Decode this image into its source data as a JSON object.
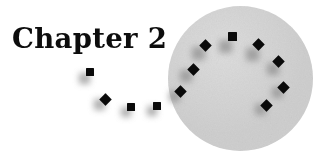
{
  "page": {
    "width": 325,
    "height": 165,
    "background_color": "#ffffff"
  },
  "title": {
    "text": "Chapter 2",
    "color": "#0d0d0d"
  },
  "disc": {
    "name": "gray-circle",
    "center_x": 240,
    "center_y": 78,
    "diameter": 145,
    "fill_color": "#cfcfcf"
  },
  "markers": {
    "square_color": "#0a0a0a",
    "shadow_color": "#8d8d8d",
    "items": [
      {
        "id": "marker-1",
        "x": 90,
        "y": 72,
        "size": 8,
        "rotation": 0,
        "shadow_dx": -6,
        "shadow_dy": 6,
        "shadow_size": 11
      },
      {
        "id": "marker-2",
        "x": 105,
        "y": 99,
        "size": 9,
        "rotation": 45,
        "shadow_dx": -6,
        "shadow_dy": 5,
        "shadow_size": 11
      },
      {
        "id": "marker-3",
        "x": 131,
        "y": 107,
        "size": 8,
        "rotation": 0,
        "shadow_dx": -5,
        "shadow_dy": 5,
        "shadow_size": 10
      },
      {
        "id": "marker-4",
        "x": 157,
        "y": 106,
        "size": 8,
        "rotation": 0,
        "shadow_dx": -5,
        "shadow_dy": 5,
        "shadow_size": 10
      },
      {
        "id": "marker-5",
        "x": 180,
        "y": 91,
        "size": 9,
        "rotation": 45,
        "shadow_dx": -6,
        "shadow_dy": 5,
        "shadow_size": 11
      },
      {
        "id": "marker-6",
        "x": 193,
        "y": 69,
        "size": 9,
        "rotation": 45,
        "shadow_dx": -7,
        "shadow_dy": 7,
        "shadow_size": 12
      },
      {
        "id": "marker-7",
        "x": 205,
        "y": 45,
        "size": 9,
        "rotation": 45,
        "shadow_dx": -7,
        "shadow_dy": 8,
        "shadow_size": 13
      },
      {
        "id": "marker-8",
        "x": 232,
        "y": 36,
        "size": 9,
        "rotation": 0,
        "shadow_dx": -7,
        "shadow_dy": 10,
        "shantom": 0,
        "shadow_size": 13
      },
      {
        "id": "marker-9",
        "x": 258,
        "y": 44,
        "size": 9,
        "rotation": 45,
        "shadow_dx": -6,
        "shadow_dy": 10,
        "shadow_size": 13
      },
      {
        "id": "marker-10",
        "x": 278,
        "y": 61,
        "size": 9,
        "rotation": 45,
        "shadow_dx": -5,
        "shadow_dy": 8,
        "shadow_size": 12
      },
      {
        "id": "marker-11",
        "x": 283,
        "y": 87,
        "size": 9,
        "rotation": 45,
        "shadow_dx": -6,
        "shadow_dy": 5,
        "shadow_size": 11
      },
      {
        "id": "marker-12",
        "x": 266,
        "y": 105,
        "size": 9,
        "rotation": 45,
        "shadow_dx": -6,
        "shadow_dy": 4,
        "shadow_size": 11
      }
    ]
  }
}
